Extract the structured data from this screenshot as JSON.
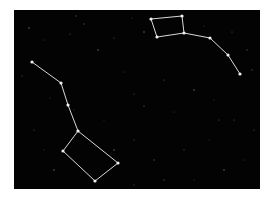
{
  "diagram": {
    "kind": "star-chart",
    "background_color": "#030303",
    "page_color": "#ffffff",
    "line_color": "#d8d8d8",
    "star_color": "#f0f0f0",
    "panel": {
      "x": 14,
      "y": 10,
      "width": 246,
      "height": 179
    },
    "constellations": [
      {
        "name": "Big Dipper",
        "stars": [
          [
            18,
            52
          ],
          [
            47,
            73
          ],
          [
            54,
            95
          ],
          [
            64,
            121
          ],
          [
            49,
            141
          ],
          [
            81,
            171
          ],
          [
            104,
            153
          ]
        ],
        "lines": [
          [
            0,
            1
          ],
          [
            1,
            2
          ],
          [
            2,
            3
          ],
          [
            3,
            4
          ],
          [
            4,
            5
          ],
          [
            5,
            6
          ],
          [
            6,
            3
          ]
        ]
      },
      {
        "name": "Little Dipper",
        "stars": [
          [
            137,
            9
          ],
          [
            168,
            6
          ],
          [
            170,
            23
          ],
          [
            143,
            27
          ],
          [
            196,
            28
          ],
          [
            214,
            45
          ],
          [
            226,
            64
          ]
        ],
        "lines": [
          [
            0,
            1
          ],
          [
            1,
            2
          ],
          [
            2,
            3
          ],
          [
            3,
            0
          ],
          [
            2,
            4
          ],
          [
            4,
            5
          ],
          [
            5,
            6
          ]
        ]
      }
    ],
    "background_stars": [
      [
        15,
        18
      ],
      [
        30,
        30
      ],
      [
        56,
        24
      ],
      [
        70,
        14
      ],
      [
        100,
        28
      ],
      [
        118,
        8
      ],
      [
        130,
        22
      ],
      [
        190,
        16
      ],
      [
        218,
        22
      ],
      [
        233,
        40
      ],
      [
        8,
        66
      ],
      [
        36,
        88
      ],
      [
        84,
        40
      ],
      [
        110,
        62
      ],
      [
        120,
        84
      ],
      [
        130,
        96
      ],
      [
        150,
        70
      ],
      [
        160,
        102
      ],
      [
        180,
        80
      ],
      [
        200,
        90
      ],
      [
        220,
        110
      ],
      [
        238,
        60
      ],
      [
        20,
        120
      ],
      [
        30,
        140
      ],
      [
        40,
        160
      ],
      [
        90,
        110
      ],
      [
        120,
        130
      ],
      [
        140,
        150
      ],
      [
        170,
        140
      ],
      [
        195,
        130
      ],
      [
        210,
        160
      ],
      [
        230,
        150
      ],
      [
        240,
        120
      ],
      [
        150,
        170
      ],
      [
        120,
        175
      ],
      [
        60,
        100
      ],
      [
        100,
        140
      ],
      [
        180,
        170
      ],
      [
        205,
        110
      ],
      [
        62,
        6
      ]
    ]
  }
}
